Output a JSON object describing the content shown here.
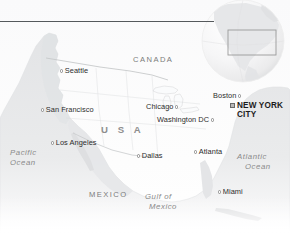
{
  "figure": {
    "width": 290,
    "height": 233,
    "background_color": "#ffffff"
  },
  "rule": {
    "name": "top-divider-rule",
    "color": "#55595c"
  },
  "colors": {
    "land": "#e9eaeb",
    "land_shadow": "#d3d5d7",
    "water": "#fbfbfc",
    "border_line": "#bdbfc1",
    "city_label": "#2c2c2c",
    "country_label": "#7b7b7b",
    "ocean_label": "#8a8a8a",
    "capital_label": "#1b1b1b",
    "capital_marker": "#b9b9b9",
    "globe": "#f4f4f5",
    "globe_box": "#9a9a9a"
  },
  "cities": [
    {
      "name": "Seattle",
      "label": "Seattle",
      "marker": "circle",
      "marker_side": "left"
    },
    {
      "name": "San Francisco",
      "label": "San Francisco",
      "marker": "circle",
      "marker_side": "left"
    },
    {
      "name": "Los Angeles",
      "label": "Los Angeles",
      "marker": "circle",
      "marker_side": "left"
    },
    {
      "name": "Chicago",
      "label": "Chicago",
      "marker": "circle",
      "marker_side": "right"
    },
    {
      "name": "Boston",
      "label": "Boston",
      "marker": "circle",
      "marker_side": "right"
    },
    {
      "name": "Washington DC",
      "label": "Washington DC",
      "marker": "circle",
      "marker_side": "right"
    },
    {
      "name": "Dallas",
      "label": "Dallas",
      "marker": "circle",
      "marker_side": "left"
    },
    {
      "name": "Atlanta",
      "label": "Atlanta",
      "marker": "circle",
      "marker_side": "left"
    },
    {
      "name": "Miami",
      "label": "Miami",
      "marker": "circle",
      "marker_side": "left"
    }
  ],
  "capital": {
    "name": "New York City",
    "line1": "NEW YORK",
    "line2": "CITY",
    "marker": "square"
  },
  "countries": [
    {
      "name": "Canada",
      "label": "CANADA"
    },
    {
      "name": "USA",
      "label": "U S A"
    },
    {
      "name": "Mexico",
      "label": "MEXICO"
    }
  ],
  "oceans": [
    {
      "name": "Pacific Ocean",
      "line1": "Pacific",
      "line2": "Ocean"
    },
    {
      "name": "Atlantic Ocean",
      "line1": "Atlantic",
      "line2": "Ocean"
    },
    {
      "name": "Gulf of Mexico",
      "line1": "Gulf of",
      "line2": "Mexico"
    }
  ],
  "globe_inset": {
    "name": "globe-inset",
    "highlight_region": "North America"
  }
}
